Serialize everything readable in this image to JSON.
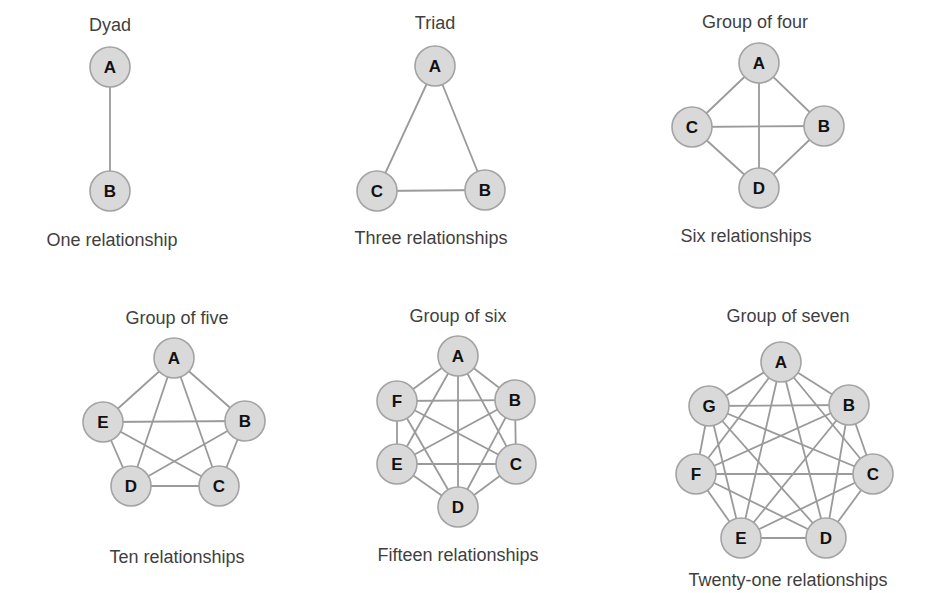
{
  "colors": {
    "node_fill": "#d9d9d9",
    "node_stroke": "#a3a3a3",
    "edge": "#9a9a9a",
    "text": "#3f3f3f",
    "node_text": "#111111"
  },
  "node_radius": 20,
  "groups": [
    {
      "id": "dyad",
      "title": "Dyad",
      "caption": "One relationship",
      "title_pos": [
        110,
        31
      ],
      "caption_pos": [
        112,
        246
      ],
      "nodes": [
        {
          "label": "A",
          "x": 110,
          "y": 67
        },
        {
          "label": "B",
          "x": 110,
          "y": 191
        }
      ]
    },
    {
      "id": "triad",
      "title": "Triad",
      "caption": "Three relationships",
      "title_pos": [
        435,
        29
      ],
      "caption_pos": [
        431,
        244
      ],
      "nodes": [
        {
          "label": "A",
          "x": 435,
          "y": 66
        },
        {
          "label": "B",
          "x": 485,
          "y": 190
        },
        {
          "label": "C",
          "x": 377,
          "y": 191
        }
      ]
    },
    {
      "id": "group-of-four",
      "title": "Group of four",
      "caption": "Six relationships",
      "title_pos": [
        755,
        28
      ],
      "caption_pos": [
        746,
        242
      ],
      "nodes": [
        {
          "label": "A",
          "x": 759,
          "y": 63
        },
        {
          "label": "B",
          "x": 824,
          "y": 126
        },
        {
          "label": "C",
          "x": 692,
          "y": 127
        },
        {
          "label": "D",
          "x": 759,
          "y": 188
        }
      ]
    },
    {
      "id": "group-of-five",
      "title": "Group of five",
      "caption": "Ten relationships",
      "title_pos": [
        177,
        324
      ],
      "caption_pos": [
        177,
        563
      ],
      "nodes": [
        {
          "label": "A",
          "x": 174,
          "y": 358
        },
        {
          "label": "B",
          "x": 245,
          "y": 421
        },
        {
          "label": "C",
          "x": 219,
          "y": 486
        },
        {
          "label": "D",
          "x": 131,
          "y": 486
        },
        {
          "label": "E",
          "x": 103,
          "y": 422
        }
      ]
    },
    {
      "id": "group-of-six",
      "title": "Group of six",
      "caption": "Fifteen relationships",
      "title_pos": [
        458,
        322
      ],
      "caption_pos": [
        458,
        561
      ],
      "nodes": [
        {
          "label": "A",
          "x": 458,
          "y": 356
        },
        {
          "label": "B",
          "x": 515,
          "y": 400
        },
        {
          "label": "C",
          "x": 516,
          "y": 464
        },
        {
          "label": "D",
          "x": 458,
          "y": 507
        },
        {
          "label": "E",
          "x": 397,
          "y": 464
        },
        {
          "label": "F",
          "x": 397,
          "y": 401
        }
      ]
    },
    {
      "id": "group-of-seven",
      "title": "Group of seven",
      "caption": "Twenty-one relationships",
      "title_pos": [
        788,
        322
      ],
      "caption_pos": [
        788,
        586
      ],
      "nodes": [
        {
          "label": "A",
          "x": 781,
          "y": 362
        },
        {
          "label": "B",
          "x": 849,
          "y": 405
        },
        {
          "label": "C",
          "x": 873,
          "y": 474
        },
        {
          "label": "D",
          "x": 826,
          "y": 538
        },
        {
          "label": "E",
          "x": 741,
          "y": 538
        },
        {
          "label": "F",
          "x": 696,
          "y": 474
        },
        {
          "label": "G",
          "x": 709,
          "y": 406
        }
      ]
    }
  ]
}
